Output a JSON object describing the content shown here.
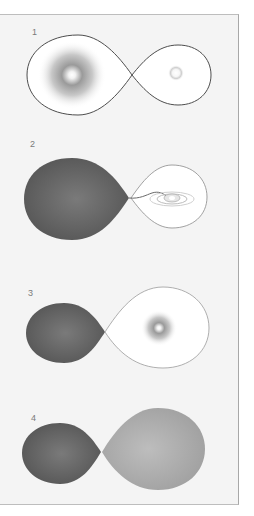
{
  "figure": {
    "panels": [
      {
        "label": "1",
        "stage": "both stars within their Roche lobes; primary larger and brighter"
      },
      {
        "label": "2",
        "stage": "primary fills its Roche lobe; mass transfer stream feeds accretion disk around companion"
      },
      {
        "label": "3",
        "stage": "mass ratio reversed; companion now larger and luminous"
      },
      {
        "label": "4",
        "stage": "both lobes filled; contact binary"
      }
    ]
  },
  "colors": {
    "background": "#f4f4f4",
    "outline": "#555555",
    "filled_dark": "#626262",
    "filled_light": "#a9a9a9",
    "glow": "#8c8c8c"
  }
}
